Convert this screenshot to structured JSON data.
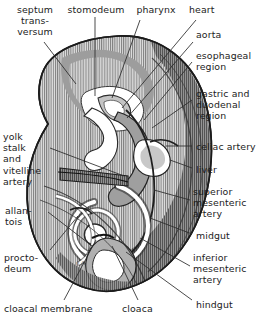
{
  "figure": {
    "artist_signature": "R.C.",
    "palette": {
      "outline": "#1b1b1b",
      "body_light": "#d8d8d8",
      "body_mid": "#b4b4b4",
      "body_dark": "#8a8a8a",
      "body_darkest": "#5e5e5e",
      "hatch": "#6f6f6f",
      "lumen": "#ffffff",
      "leader_line": "#2a2a2a",
      "text": "#1c1c1c",
      "background": "#ffffff"
    }
  },
  "labels": [
    {
      "id": "septum-transversum",
      "text": "septum\ntrans-\nversum",
      "x": 4,
      "y": 4,
      "align": "center",
      "width": 62
    },
    {
      "id": "stomodeum",
      "text": "stomodeum",
      "x": 62,
      "y": 4,
      "align": "center",
      "width": 68
    },
    {
      "id": "pharynx",
      "text": "pharynx",
      "x": 131,
      "y": 4,
      "align": "center",
      "width": 50
    },
    {
      "id": "heart",
      "text": "heart",
      "x": 189,
      "y": 4,
      "align": "left",
      "width": 44
    },
    {
      "id": "aorta",
      "text": "aorta",
      "x": 196,
      "y": 29,
      "align": "left",
      "width": 44
    },
    {
      "id": "esophageal-region",
      "text": "esophageal\nregion",
      "x": 196,
      "y": 50,
      "align": "left",
      "width": 70
    },
    {
      "id": "gastric-duodenal-region",
      "text": "gastric and\nduodenal\nregion",
      "x": 196,
      "y": 88,
      "align": "left",
      "width": 72
    },
    {
      "id": "celiac-artery",
      "text": "celiac artery",
      "x": 196,
      "y": 141,
      "align": "left",
      "width": 72
    },
    {
      "id": "liver",
      "text": "liver",
      "x": 196,
      "y": 164,
      "align": "left",
      "width": 44
    },
    {
      "id": "superior-mesenteric-artery",
      "text": "superior\nmesenteric\nartery",
      "x": 193,
      "y": 186,
      "align": "left",
      "width": 74
    },
    {
      "id": "midgut",
      "text": "midgut",
      "x": 196,
      "y": 230,
      "align": "left",
      "width": 48
    },
    {
      "id": "inferior-mesenteric-artery",
      "text": "inferior\nmesenteric\nartery",
      "x": 193,
      "y": 252,
      "align": "left",
      "width": 74
    },
    {
      "id": "hindgut",
      "text": "hindgut",
      "x": 196,
      "y": 299,
      "align": "left",
      "width": 50
    },
    {
      "id": "yolk-stalk-vitelline-artery",
      "text": "yolk\nstalk\nand\nvitelline\nartery",
      "x": 3,
      "y": 131,
      "align": "left",
      "width": 52
    },
    {
      "id": "allantois",
      "text": "allan-\ntois",
      "x": 5,
      "y": 205,
      "align": "left",
      "width": 44
    },
    {
      "id": "proctodeum",
      "text": "procto-\ndeum",
      "x": 4,
      "y": 252,
      "align": "left",
      "width": 50
    },
    {
      "id": "cloacal-membrane",
      "text": "cloacal membrane",
      "x": 4,
      "y": 303,
      "align": "left",
      "width": 104
    },
    {
      "id": "cloaca",
      "text": "cloaca",
      "x": 122,
      "y": 303,
      "align": "left",
      "width": 44
    },
    {
      "id": "hindgut-bottom",
      "text": "",
      "x": 0,
      "y": 0,
      "align": "left",
      "width": 0
    }
  ],
  "leader_lines": [
    {
      "id": "leader-septum-transversum",
      "x1": 44,
      "y1": 42,
      "x2": 76,
      "y2": 84
    },
    {
      "id": "leader-stomodeum",
      "x1": 95,
      "y1": 17,
      "x2": 95,
      "y2": 96
    },
    {
      "id": "leader-pharynx",
      "x1": 140,
      "y1": 20,
      "x2": 112,
      "y2": 98
    },
    {
      "id": "leader-heart",
      "x1": 196,
      "y1": 20,
      "x2": 122,
      "y2": 108
    },
    {
      "id": "leader-aorta",
      "x1": 193,
      "y1": 42,
      "x2": 127,
      "y2": 118
    },
    {
      "id": "leader-esophageal",
      "x1": 192,
      "y1": 62,
      "x2": 144,
      "y2": 120
    },
    {
      "id": "leader-gastric",
      "x1": 192,
      "y1": 100,
      "x2": 152,
      "y2": 128
    },
    {
      "id": "leader-celiac",
      "x1": 192,
      "y1": 146,
      "x2": 166,
      "y2": 146
    },
    {
      "id": "leader-liver",
      "x1": 192,
      "y1": 168,
      "x2": 170,
      "y2": 160
    },
    {
      "id": "leader-superior-mesenteric",
      "x1": 190,
      "y1": 200,
      "x2": 154,
      "y2": 190
    },
    {
      "id": "leader-midgut",
      "x1": 192,
      "y1": 234,
      "x2": 150,
      "y2": 218
    },
    {
      "id": "leader-inferior-mesenteric",
      "x1": 190,
      "y1": 266,
      "x2": 140,
      "y2": 238
    },
    {
      "id": "leader-hindgut",
      "x1": 192,
      "y1": 300,
      "x2": 126,
      "y2": 252
    },
    {
      "id": "leader-yolk-stalk",
      "x1": 50,
      "y1": 148,
      "x2": 124,
      "y2": 176
    },
    {
      "id": "leader-allantois",
      "x1": 48,
      "y1": 212,
      "x2": 92,
      "y2": 246
    },
    {
      "id": "leader-proctodeum",
      "x1": 50,
      "y1": 250,
      "x2": 78,
      "y2": 216
    },
    {
      "id": "leader-cloacal-membrane",
      "x1": 64,
      "y1": 300,
      "x2": 96,
      "y2": 240
    },
    {
      "id": "leader-cloaca",
      "x1": 138,
      "y1": 300,
      "x2": 112,
      "y2": 246
    }
  ]
}
